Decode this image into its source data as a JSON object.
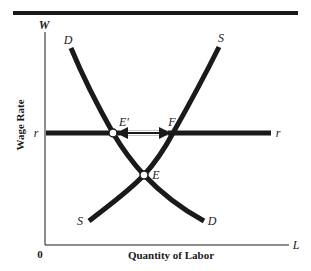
{
  "diagram": {
    "type": "supply-demand",
    "title": "",
    "colors": {
      "ink": "#1a1a1a",
      "background": "#ffffff"
    },
    "axes": {
      "y_axis_symbol": "W",
      "y_axis_label": "Wage Rate",
      "x_axis_symbol": "L",
      "x_axis_label": "Quantity of Labor",
      "origin": "0"
    },
    "curves": {
      "demand": {
        "top_label": "D",
        "bottom_label": "D"
      },
      "supply": {
        "top_label": "S",
        "bottom_label": "S"
      }
    },
    "wage_floor": {
      "left_label": "r",
      "right_label": "r"
    },
    "points": {
      "e_prime": "E′",
      "f": "F",
      "e": "E"
    }
  }
}
